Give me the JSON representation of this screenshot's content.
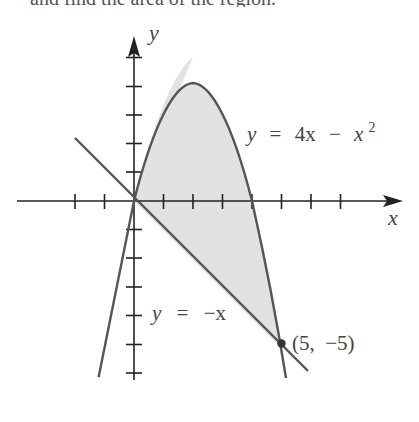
{
  "header": {
    "clipped_caption": "and find the area of the region."
  },
  "diagram": {
    "axes": {
      "x_label": "x",
      "y_label": "y",
      "x_ticks": [
        -2,
        -1,
        1,
        2,
        3,
        4,
        5,
        6,
        7,
        8
      ],
      "y_ticks": [
        5,
        4,
        3,
        2,
        1,
        -1,
        -2,
        -3,
        -4,
        -5,
        -6
      ]
    },
    "curves": [
      {
        "name": "parabola",
        "equation": "y = 4x − x²",
        "label_lhs": "y",
        "label_eq": "=",
        "label_rhs_a": "4x",
        "label_minus": "−",
        "label_rhs_b": "x",
        "label_exp": "2"
      },
      {
        "name": "line",
        "equation": "y = −x",
        "label_lhs": "y",
        "label_eq": "=",
        "label_rhs": "−x"
      }
    ],
    "intersections": [
      {
        "x": 0,
        "y": 0
      },
      {
        "x": 5,
        "y": -5,
        "label": "(5,  −5)"
      }
    ],
    "shaded_region": "between y = 4x − x² and y = −x for 0 ≤ x ≤ 5",
    "colors": {
      "shade": "#e2e2e2",
      "curve": "#555555",
      "axis": "#222222"
    }
  }
}
